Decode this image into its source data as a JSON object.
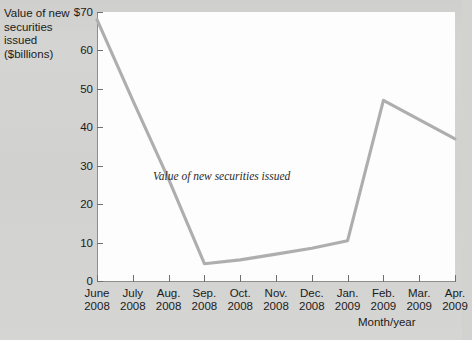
{
  "chart_data": {
    "type": "line",
    "title": "",
    "xlabel": "Month/year",
    "ylabel": "Value of new securities issued ($billions)",
    "ylabel_lines": [
      "Value of new",
      "securities",
      "issued",
      "($billions)"
    ],
    "categories": [
      "June 2008",
      "July 2008",
      "Aug. 2008",
      "Sep. 2008",
      "Oct. 2008",
      "Nov. 2008",
      "Dec. 2008",
      "Jan. 2009",
      "Feb. 2009",
      "Mar. 2009",
      "Apr. 2009"
    ],
    "category_lines": [
      [
        "June",
        "2008"
      ],
      [
        "July",
        "2008"
      ],
      [
        "Aug.",
        "2008"
      ],
      [
        "Sep.",
        "2008"
      ],
      [
        "Oct.",
        "2008"
      ],
      [
        "Nov.",
        "2008"
      ],
      [
        "Dec.",
        "2008"
      ],
      [
        "Jan.",
        "2009"
      ],
      [
        "Feb.",
        "2009"
      ],
      [
        "Mar.",
        "2009"
      ],
      [
        "Apr.",
        "2009"
      ]
    ],
    "values": [
      68,
      47,
      26.5,
      4.5,
      5.5,
      7,
      8.5,
      10.5,
      47,
      42,
      37
    ],
    "series": [
      {
        "name": "Value of new securities issued",
        "values": [
          68,
          47,
          26.5,
          4.5,
          5.5,
          7,
          8.5,
          10.5,
          47,
          42,
          37
        ]
      }
    ],
    "annotation": "Value of new securities issued",
    "ylim": [
      0,
      70
    ],
    "yticks": [
      0,
      10,
      20,
      30,
      40,
      50,
      60,
      70
    ],
    "ytick_labels": [
      "0",
      "10",
      "20",
      "30",
      "40",
      "50",
      "60",
      "$70"
    ],
    "grid": false,
    "legend": "none",
    "line_color": "#aeaeae",
    "plot_background": "#fdfdfd",
    "page_background": "#d2d2d0",
    "axis_color": "#8e8e8e",
    "text_color": "#1b1b1b"
  }
}
